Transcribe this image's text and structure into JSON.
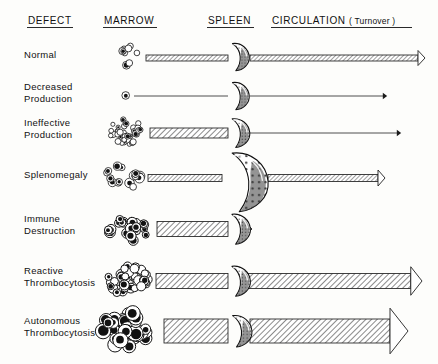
{
  "figure": {
    "background": "#fdfdfb",
    "ink": "#111111"
  },
  "headers": [
    {
      "id": "defect",
      "label": "DEFECT",
      "x": 28,
      "y": 24,
      "underline_w": 46
    },
    {
      "id": "marrow",
      "label": "MARROW",
      "x": 104,
      "y": 24,
      "underline_w": 54
    },
    {
      "id": "spleen",
      "label": "SPLEEN",
      "x": 208,
      "y": 24,
      "underline_w": 47
    },
    {
      "id": "circulation",
      "label": "CIRCULATION ( Turnover )",
      "x": 272,
      "y": 24,
      "underline_w": 141
    }
  ],
  "rows": [
    {
      "id": "normal",
      "label_lines": [
        "Normal"
      ],
      "label_y": 58,
      "center_y": 58,
      "marrow": {
        "cx": 130,
        "cy": 56,
        "count": 9,
        "cell_r": 3.2,
        "spread_x": 13,
        "spread_y": 11,
        "fill_ratio": 0.45
      },
      "in_band": {
        "x1": 146,
        "x2": 228,
        "thickness": 6,
        "style": "hatched"
      },
      "spleen": {
        "cx": 238,
        "cy": 56,
        "scale": 1.0
      },
      "out_band": {
        "x1": 250,
        "x2": 425,
        "thickness": 6,
        "style": "hatched",
        "head": "open"
      }
    },
    {
      "id": "decreased-production",
      "label_lines": [
        "Decreased",
        "Production"
      ],
      "label_y": 90,
      "center_y": 96,
      "marrow": {
        "cx": 124,
        "cy": 95,
        "count": 1,
        "cell_r": 3.6,
        "spread_x": 2,
        "spread_y": 2,
        "fill_ratio": 1.0
      },
      "in_band": {
        "x1": 134,
        "x2": 228,
        "thickness": 1,
        "style": "line"
      },
      "spleen": {
        "cx": 238,
        "cy": 95,
        "scale": 1.0
      },
      "out_band": {
        "x1": 250,
        "x2": 386,
        "thickness": 1,
        "style": "line",
        "head": "tiny"
      }
    },
    {
      "id": "ineffective-production",
      "label_lines": [
        "Ineffective",
        "Production"
      ],
      "label_y": 126,
      "center_y": 133,
      "marrow": {
        "cx": 128,
        "cy": 132,
        "count": 34,
        "cell_r": 2.6,
        "spread_x": 20,
        "spread_y": 13,
        "fill_ratio": 0.35
      },
      "in_band": {
        "x1": 150,
        "x2": 228,
        "thickness": 10,
        "style": "hatched"
      },
      "spleen": {
        "cx": 238,
        "cy": 132,
        "scale": 1.05
      },
      "out_band": {
        "x1": 250,
        "x2": 400,
        "thickness": 1,
        "style": "line",
        "head": "tiny"
      }
    },
    {
      "id": "splenomegaly",
      "label_lines": [
        "Splenomegaly"
      ],
      "label_y": 178,
      "center_y": 178,
      "marrow": {
        "cx": 124,
        "cy": 176,
        "count": 15,
        "cell_r": 4.0,
        "spread_x": 18,
        "spread_y": 13,
        "fill_ratio": 0.75
      },
      "in_band": {
        "x1": 148,
        "x2": 222,
        "thickness": 7,
        "style": "hatched"
      },
      "spleen": {
        "cx": 244,
        "cy": 180,
        "scale": 2.15
      },
      "out_band": {
        "x1": 268,
        "x2": 385,
        "thickness": 7,
        "style": "hatched",
        "head": "open"
      }
    },
    {
      "id": "immune-destruction",
      "label_lines": [
        "Immune",
        "Destruction"
      ],
      "label_y": 222,
      "center_y": 229,
      "marrow": {
        "cx": 128,
        "cy": 228,
        "count": 22,
        "cell_r": 4.4,
        "spread_x": 21,
        "spread_y": 15,
        "fill_ratio": 0.9
      },
      "in_band": {
        "x1": 157,
        "x2": 228,
        "thickness": 15,
        "style": "hatched"
      },
      "spleen": {
        "cx": 238,
        "cy": 228,
        "scale": 1.1
      },
      "out_band": {
        "x1": 248,
        "x2": 252,
        "thickness": 5,
        "style": "hatched",
        "head": "open"
      }
    },
    {
      "id": "reactive-thrombocytosis",
      "label_lines": [
        "Reactive",
        "Thrombocytosis"
      ],
      "label_y": 274,
      "center_y": 281,
      "marrow": {
        "cx": 128,
        "cy": 280,
        "count": 40,
        "cell_r": 4.2,
        "spread_x": 22,
        "spread_y": 15,
        "fill_ratio": 0.5
      },
      "in_band": {
        "x1": 156,
        "x2": 228,
        "thickness": 15,
        "style": "hatched"
      },
      "spleen": {
        "cx": 238,
        "cy": 280,
        "scale": 1.1
      },
      "out_band": {
        "x1": 248,
        "x2": 422,
        "thickness": 15,
        "style": "hatched",
        "head": "open"
      }
    },
    {
      "id": "autonomous-thrombocytosis",
      "label_lines": [
        "Autonomous",
        "Thrombocytosis"
      ],
      "label_y": 324,
      "center_y": 331,
      "marrow": {
        "cx": 126,
        "cy": 330,
        "count": 36,
        "cell_r": 6.4,
        "spread_x": 24,
        "spread_y": 19,
        "fill_ratio": 0.95
      },
      "in_band": {
        "x1": 164,
        "x2": 228,
        "thickness": 24,
        "style": "hatched"
      },
      "spleen": {
        "cx": 239,
        "cy": 330,
        "scale": 1.15
      },
      "out_band": {
        "x1": 250,
        "x2": 408,
        "thickness": 24,
        "style": "hatched",
        "head": "open"
      }
    }
  ]
}
